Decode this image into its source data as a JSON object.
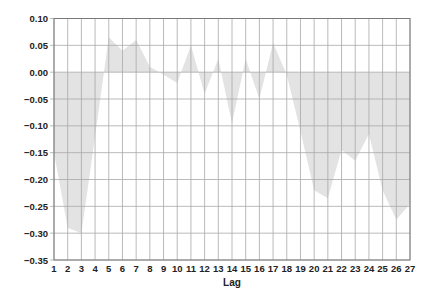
{
  "chart_data": {
    "type": "area",
    "title": "",
    "xlabel": "Lag",
    "ylabel": "",
    "categories": [
      "1",
      "2",
      "3",
      "4",
      "5",
      "6",
      "7",
      "8",
      "9",
      "10",
      "11",
      "12",
      "13",
      "14",
      "15",
      "16",
      "17",
      "18",
      "19",
      "20",
      "21",
      "22",
      "23",
      "24",
      "25",
      "26",
      "27"
    ],
    "series": [
      {
        "name": "Autocorrelation",
        "values": [
          -0.15,
          -0.29,
          -0.3,
          -0.12,
          0.065,
          0.04,
          0.06,
          0.01,
          -0.005,
          -0.02,
          0.05,
          -0.04,
          0.025,
          -0.095,
          0.025,
          -0.05,
          0.055,
          -0.005,
          -0.11,
          -0.22,
          -0.235,
          -0.145,
          -0.165,
          -0.115,
          -0.22,
          -0.275,
          -0.245
        ]
      }
    ],
    "ylim": [
      -0.35,
      0.1
    ],
    "yticks": [
      "0.10",
      "0.05",
      "0.00",
      "-0.05",
      "-0.10",
      "-0.15",
      "-0.20",
      "-0.25",
      "-0.30",
      "-0.35"
    ],
    "ytick_values": [
      0.1,
      0.05,
      0.0,
      -0.05,
      -0.1,
      -0.15,
      -0.2,
      -0.25,
      -0.3,
      -0.35
    ],
    "grid": true,
    "legend": "none"
  },
  "colors": {
    "fill": "#e3e3e3",
    "grid": "#a8a8a8",
    "axis": "#7a7a7a",
    "text": "#222222"
  }
}
